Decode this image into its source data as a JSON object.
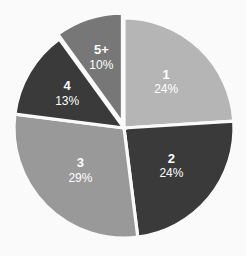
{
  "chart_data": {
    "type": "pie",
    "title": "",
    "subtitle": "",
    "xlabel": "",
    "ylabel": "",
    "legend_position": "none",
    "grid": false,
    "background_color": "#fafafa",
    "separator_color": "#fafafa",
    "label_text_color": "#ffffff",
    "start_angle_deg": 0,
    "direction": "clockwise",
    "categories": [
      "1",
      "2",
      "3",
      "4",
      "5+"
    ],
    "values": [
      24,
      24,
      29,
      13,
      10
    ],
    "value_unit": "%",
    "value_labels": [
      "24%",
      "24%",
      "29%",
      "13%",
      "10%"
    ],
    "colors": [
      "#b5b5b5",
      "#3a3a3a",
      "#999999",
      "#3a3a3a",
      "#777777"
    ],
    "slices": [
      {
        "name": "1",
        "value": 24,
        "value_label": "24%",
        "color": "#b5b5b5",
        "start_deg": 0,
        "end_deg": 86.4,
        "exploded": false
      },
      {
        "name": "2",
        "value": 24,
        "value_label": "24%",
        "color": "#3a3a3a",
        "start_deg": 86.4,
        "end_deg": 172.8,
        "exploded": false
      },
      {
        "name": "3",
        "value": 29,
        "value_label": "29%",
        "color": "#999999",
        "start_deg": 172.8,
        "end_deg": 277.2,
        "exploded": false
      },
      {
        "name": "4",
        "value": 13,
        "value_label": "13%",
        "color": "#3a3a3a",
        "start_deg": 277.2,
        "end_deg": 324.0,
        "exploded": false
      },
      {
        "name": "5+",
        "value": 10,
        "value_label": "10%",
        "color": "#777777",
        "start_deg": 324.0,
        "end_deg": 360.0,
        "exploded": true
      }
    ],
    "geometry": {
      "center_x": 124,
      "center_y": 128,
      "radius": 110
    }
  }
}
